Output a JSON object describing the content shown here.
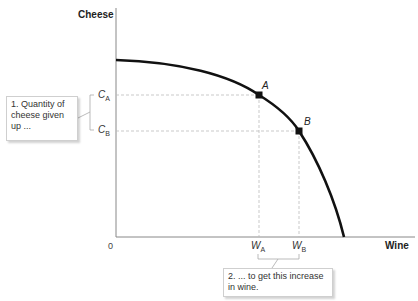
{
  "axes": {
    "y_title": "Cheese",
    "x_title": "Wine",
    "origin": "0"
  },
  "ticks": {
    "c_a": {
      "main": "C",
      "sub": "A"
    },
    "c_b": {
      "main": "C",
      "sub": "B"
    },
    "w_a": {
      "main": "W",
      "sub": "A"
    },
    "w_b": {
      "main": "W",
      "sub": "B"
    }
  },
  "points": {
    "a": "A",
    "b": "B"
  },
  "callouts": {
    "cheese": "1.  Quantity of cheese given up ...",
    "wine": "2. ... to get this increase in wine."
  },
  "colors": {
    "curve": "#111111",
    "axis": "#888888",
    "guide": "#bbbbbb"
  }
}
